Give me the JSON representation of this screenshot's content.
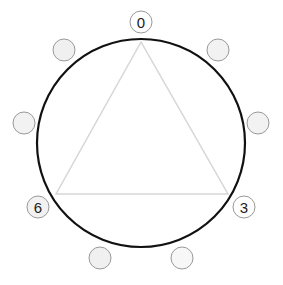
{
  "diagram": {
    "main_circle": {
      "cx": 141,
      "cy": 143,
      "r": 104,
      "stroke": "#111111"
    },
    "triangle": {
      "points": "141,42 56,194 228,194",
      "stroke": "#d0d0d0"
    },
    "nodes": [
      {
        "id": "n0",
        "label": "0",
        "cx": 141,
        "cy": 22
      },
      {
        "id": "n1",
        "label": "",
        "cx": 218,
        "cy": 50
      },
      {
        "id": "n2",
        "label": "",
        "cx": 258,
        "cy": 123
      },
      {
        "id": "n3",
        "label": "3",
        "cx": 244,
        "cy": 207
      },
      {
        "id": "n4",
        "label": "",
        "cx": 182,
        "cy": 258
      },
      {
        "id": "n5",
        "label": "",
        "cx": 100,
        "cy": 258
      },
      {
        "id": "n6",
        "label": "6",
        "cx": 38,
        "cy": 207
      },
      {
        "id": "n7",
        "label": "",
        "cx": 24,
        "cy": 123
      },
      {
        "id": "n8",
        "label": "",
        "cx": 64,
        "cy": 50
      }
    ]
  }
}
